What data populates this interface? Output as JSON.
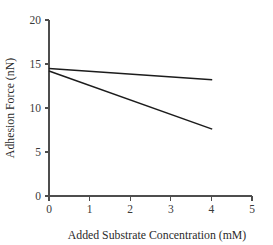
{
  "chart_data": {
    "type": "line",
    "title": "",
    "xlabel": "Added Substrate Concentration (mM)",
    "ylabel": "Adhesion Force (nN)",
    "xlim": [
      0,
      5
    ],
    "ylim": [
      0,
      20
    ],
    "xticks": [
      0,
      1,
      2,
      3,
      4,
      5
    ],
    "yticks": [
      0,
      5,
      10,
      15,
      20
    ],
    "xtick_labels": [
      "0",
      "1",
      "2",
      "3",
      "4",
      "5"
    ],
    "ytick_labels": [
      "0",
      "5",
      "10",
      "15",
      "20"
    ],
    "grid": false,
    "legend": false,
    "legend_position": "none",
    "line_color": "#1c1c1c",
    "axis_color": "#4d4d4d",
    "background_color": "#ffffff",
    "series": [
      {
        "name": "shallow-decline",
        "x": [
          0,
          4.02
        ],
        "values": [
          14.5,
          13.2
        ]
      },
      {
        "name": "steep-decline",
        "x": [
          0,
          4.02
        ],
        "values": [
          14.2,
          7.6
        ]
      }
    ]
  }
}
